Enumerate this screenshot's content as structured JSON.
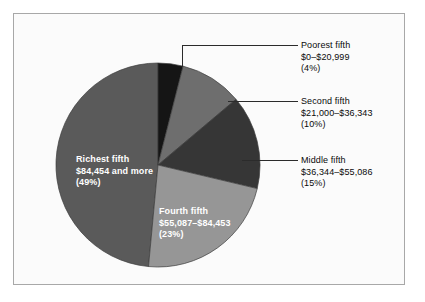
{
  "figure": {
    "background_color": "#fbfbfb",
    "border_color": "#a8a8a8"
  },
  "chart_data": {
    "type": "pie",
    "title": "",
    "subtitle": "",
    "xlabel": "",
    "ylabel": "",
    "legend_position": "none",
    "grid": false,
    "start_angle_deg": 0,
    "direction": "clockwise",
    "categories": [
      "Poorest fifth",
      "Second fifth",
      "Middle fifth",
      "Fourth fifth",
      "Richest fifth"
    ],
    "values": [
      4,
      10,
      15,
      23,
      49
    ],
    "value_unit": "percent",
    "colors": [
      "#151515",
      "#6e6e6e",
      "#363636",
      "#969696",
      "#5a5a5a"
    ],
    "slices": [
      {
        "name": "Poorest fifth",
        "range": "$0–$20,999",
        "percent": 4,
        "percent_label": "(4%)",
        "color": "#151515",
        "label_placement": "outside",
        "label_side": "right"
      },
      {
        "name": "Second fifth",
        "range": "$21,000–$36,343",
        "percent": 10,
        "percent_label": "(10%)",
        "color": "#6e6e6e",
        "label_placement": "outside",
        "label_side": "right"
      },
      {
        "name": "Middle fifth",
        "range": "$36,344–$55,086",
        "percent": 15,
        "percent_label": "(15%)",
        "color": "#363636",
        "label_placement": "outside",
        "label_side": "right"
      },
      {
        "name": "Fourth fifth",
        "range": "$55,087–$84,453",
        "percent": 23,
        "percent_label": "(23%)",
        "color": "#969696",
        "label_placement": "inside",
        "label_side": "bottom"
      },
      {
        "name": "Richest fifth",
        "range": "$84,454 and more",
        "percent": 49,
        "percent_label": "(49%)",
        "color": "#5a5a5a",
        "label_placement": "inside",
        "label_side": "left"
      }
    ]
  }
}
